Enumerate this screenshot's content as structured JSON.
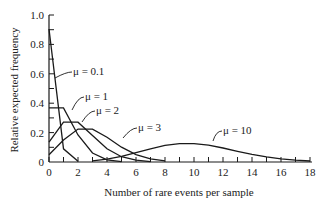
{
  "chart_data": {
    "type": "line",
    "title": "",
    "xlabel": "Number of rare events per sample",
    "ylabel": "Relative expected frequency",
    "xlim": [
      0,
      18
    ],
    "ylim": [
      0,
      1.0
    ],
    "x_ticks": [
      0,
      2,
      4,
      6,
      8,
      10,
      12,
      14,
      16,
      18
    ],
    "y_ticks": [
      "0",
      "0.2",
      "0.4",
      "0.6",
      "0.8",
      "1.0"
    ],
    "grid": false,
    "legend": "inline annotations",
    "series": [
      {
        "name": "μ = 0.1",
        "x": [
          0,
          1,
          2
        ],
        "values": [
          0.905,
          0.09,
          0.005
        ]
      },
      {
        "name": "μ = 1",
        "x": [
          0,
          1,
          2,
          3,
          4,
          5
        ],
        "values": [
          0.368,
          0.368,
          0.184,
          0.061,
          0.015,
          0.003
        ]
      },
      {
        "name": "μ = 2",
        "x": [
          0,
          1,
          2,
          3,
          4,
          5,
          6,
          7
        ],
        "values": [
          0.135,
          0.271,
          0.271,
          0.18,
          0.09,
          0.036,
          0.012,
          0.003
        ]
      },
      {
        "name": "μ = 3",
        "x": [
          0,
          1,
          2,
          3,
          4,
          5,
          6,
          7,
          8
        ],
        "values": [
          0.05,
          0.149,
          0.224,
          0.224,
          0.168,
          0.101,
          0.05,
          0.022,
          0.008
        ]
      },
      {
        "name": "μ = 10",
        "x": [
          3,
          4,
          5,
          6,
          7,
          8,
          9,
          10,
          11,
          12,
          13,
          14,
          15,
          16,
          17,
          18
        ],
        "values": [
          0.008,
          0.019,
          0.038,
          0.063,
          0.09,
          0.113,
          0.125,
          0.125,
          0.114,
          0.095,
          0.073,
          0.052,
          0.035,
          0.022,
          0.013,
          0.007
        ]
      }
    ],
    "annotations": [
      {
        "text": "μ = 0.1",
        "series": 0
      },
      {
        "text": "μ = 1",
        "series": 1
      },
      {
        "text": "μ = 2",
        "series": 2
      },
      {
        "text": "μ = 3",
        "series": 3
      },
      {
        "text": "μ = 10",
        "series": 4
      }
    ]
  }
}
